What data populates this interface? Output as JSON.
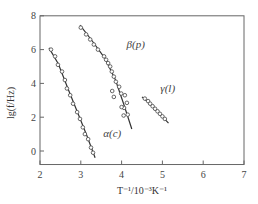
{
  "chart_data": {
    "type": "scatter",
    "title": "",
    "xlabel": "T⁻¹/10⁻³K⁻¹",
    "ylabel": "lg(f/Hz)",
    "xlim": [
      2,
      7
    ],
    "ylim": [
      -0.8,
      8
    ],
    "xticks": [
      2,
      3,
      4,
      5,
      6,
      7
    ],
    "yticks": [
      0,
      2,
      4,
      6,
      8
    ],
    "grid": false,
    "legend": "none (inline labels)",
    "series": [
      {
        "name": "α(c)",
        "label": "α(c)",
        "label_pos": [
          3.55,
          0.8
        ],
        "marker": "open-circle",
        "points": [
          [
            2.27,
            6.0
          ],
          [
            2.37,
            5.6
          ],
          [
            2.44,
            5.1
          ],
          [
            2.54,
            4.7
          ],
          [
            2.61,
            4.2
          ],
          [
            2.66,
            3.7
          ],
          [
            2.74,
            3.3
          ],
          [
            2.81,
            2.8
          ],
          [
            2.91,
            2.3
          ],
          [
            2.98,
            1.9
          ],
          [
            3.05,
            1.4
          ],
          [
            3.1,
            1.0
          ],
          [
            3.18,
            0.7
          ],
          [
            3.25,
            0.2
          ],
          [
            3.3,
            -0.1
          ]
        ],
        "fit_line": [
          [
            2.22,
            6.1
          ],
          [
            2.45,
            5.15
          ],
          [
            2.7,
            3.6
          ],
          [
            2.95,
            2.1
          ],
          [
            3.15,
            0.9
          ],
          [
            3.35,
            -0.4
          ]
        ]
      },
      {
        "name": "β(p)",
        "label": "β(p)",
        "label_pos": [
          4.12,
          6.1
        ],
        "marker": "open-circle",
        "points": [
          [
            3.0,
            7.3
          ],
          [
            3.13,
            6.9
          ],
          [
            3.23,
            6.6
          ],
          [
            3.32,
            6.3
          ],
          [
            3.42,
            6.0
          ],
          [
            3.57,
            5.6
          ],
          [
            3.62,
            5.4
          ],
          [
            3.67,
            5.2
          ],
          [
            3.72,
            5.0
          ],
          [
            3.76,
            4.7
          ],
          [
            3.81,
            4.4
          ],
          [
            3.86,
            4.1
          ],
          [
            3.94,
            3.8
          ],
          [
            3.99,
            3.4
          ],
          [
            3.77,
            3.55
          ],
          [
            3.81,
            3.2
          ],
          [
            4.08,
            3.3
          ],
          [
            4.13,
            2.85
          ],
          [
            4.06,
            2.55
          ],
          [
            4.15,
            2.15
          ],
          [
            4.0,
            2.6
          ],
          [
            4.05,
            2.1
          ]
        ],
        "fit_line": [
          [
            2.98,
            7.45
          ],
          [
            3.3,
            6.45
          ],
          [
            3.6,
            5.45
          ],
          [
            3.85,
            4.2
          ],
          [
            4.05,
            2.8
          ],
          [
            4.25,
            1.3
          ]
        ]
      },
      {
        "name": "γ(l)",
        "label": "γ(l)",
        "label_pos": [
          4.95,
          3.5
        ],
        "marker": "open-circle",
        "points": [
          [
            4.57,
            3.1
          ],
          [
            4.65,
            2.95
          ],
          [
            4.7,
            2.8
          ],
          [
            4.76,
            2.65
          ],
          [
            4.82,
            2.5
          ],
          [
            4.88,
            2.35
          ],
          [
            4.94,
            2.2
          ],
          [
            5.0,
            2.05
          ],
          [
            5.06,
            1.9
          ]
        ],
        "fit_line": [
          [
            4.5,
            3.2
          ],
          [
            4.8,
            2.55
          ],
          [
            5.15,
            1.65
          ]
        ]
      }
    ]
  },
  "colors": {
    "axis": "#666666",
    "line": "#333333",
    "marker": "#555555",
    "background": "#ffffff"
  }
}
